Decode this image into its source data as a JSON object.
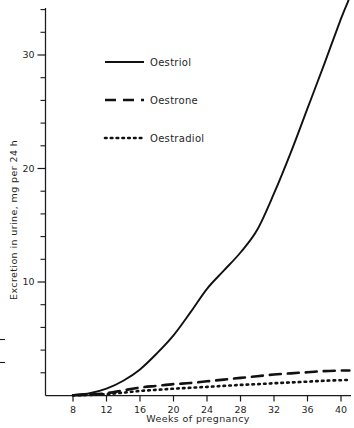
{
  "chart_data": {
    "type": "line",
    "title": "",
    "xlabel": "Weeks  of  pregnancy",
    "ylabel": "Excretion in urine, mg per 24 h",
    "xlim": [
      4,
      42
    ],
    "ylim": [
      0,
      35
    ],
    "grid": false,
    "legend_position": "upper-left-inside",
    "x_ticks": [
      8,
      12,
      16,
      20,
      24,
      28,
      32,
      36,
      40
    ],
    "x_tick_labels": [
      "8",
      "12",
      "16",
      "20",
      "24",
      "28",
      "32",
      "36",
      "40"
    ],
    "y_ticks": [
      10,
      20,
      30
    ],
    "y_tick_labels": [
      "10",
      "20",
      "30"
    ],
    "y_minor_tick_step": 2,
    "x": [
      8,
      10,
      12,
      14,
      16,
      18,
      20,
      22,
      24,
      26,
      28,
      30,
      32,
      34,
      36,
      38,
      40,
      41
    ],
    "series": [
      {
        "name": "Oestriol",
        "style": "solid",
        "color": "#111111",
        "values": [
          0.05,
          0.2,
          0.6,
          1.3,
          2.3,
          3.7,
          5.3,
          7.3,
          9.4,
          11.0,
          12.6,
          14.6,
          17.8,
          21.4,
          25.3,
          29.2,
          33.2,
          35.0
        ]
      },
      {
        "name": "Oestrone",
        "style": "dashed",
        "color": "#111111",
        "values": [
          0.02,
          0.08,
          0.2,
          0.45,
          0.7,
          0.85,
          1.0,
          1.1,
          1.25,
          1.4,
          1.55,
          1.7,
          1.85,
          1.95,
          2.05,
          2.15,
          2.2,
          2.2
        ]
      },
      {
        "name": "Oestradiol",
        "style": "dotted",
        "color": "#111111",
        "values": [
          0.01,
          0.05,
          0.12,
          0.25,
          0.4,
          0.5,
          0.6,
          0.68,
          0.76,
          0.85,
          0.93,
          1.0,
          1.08,
          1.15,
          1.22,
          1.3,
          1.35,
          1.38
        ]
      }
    ]
  },
  "legend": {
    "items": [
      {
        "label": "Oestriol",
        "style": "solid"
      },
      {
        "label": "Oestrone",
        "style": "dashed"
      },
      {
        "label": "Oestradiol",
        "style": "dotted"
      }
    ]
  },
  "axes": {
    "x_title": "Weeks  of  pregnancy",
    "y_title": "Excretion in urine, mg per 24 h"
  }
}
